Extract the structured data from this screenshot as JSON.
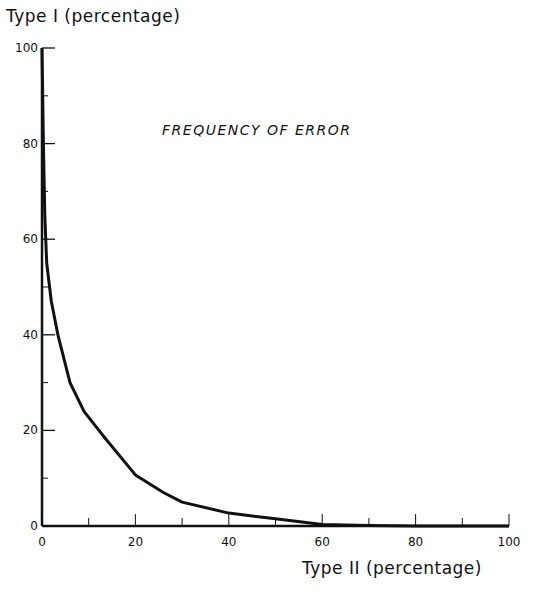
{
  "chart_data": {
    "type": "line",
    "title": "FREQUENCY OF ERROR",
    "xlabel": "Type II (percentage)",
    "ylabel": "Type I (percentage)",
    "xlim": [
      0,
      100
    ],
    "ylim": [
      0,
      100
    ],
    "x_ticks": [
      0,
      20,
      40,
      60,
      80,
      100
    ],
    "y_ticks": [
      0,
      20,
      40,
      60,
      80,
      100
    ],
    "x_minor_ticks": [
      10,
      30,
      50,
      70,
      90
    ],
    "y_minor_ticks": [
      10,
      30,
      50,
      70,
      90
    ],
    "grid": false,
    "legend": null,
    "series": [
      {
        "name": "Type I vs Type II error",
        "x": [
          0,
          0.3,
          0.6,
          1,
          2,
          3.4,
          6,
          9,
          13,
          20,
          26,
          30,
          40,
          50,
          60,
          70,
          80,
          90,
          100
        ],
        "y": [
          100,
          80,
          65,
          55,
          47,
          40,
          30,
          24,
          19,
          10.7,
          7,
          5,
          2.7,
          1.5,
          0.3,
          0.1,
          0,
          0,
          0
        ]
      }
    ],
    "line_color": "#111111"
  },
  "labels": {
    "ylabel": "Type I  (percentage)",
    "xlabel": "Type II  (percentage)",
    "title": "FREQUENCY OF ERROR"
  }
}
